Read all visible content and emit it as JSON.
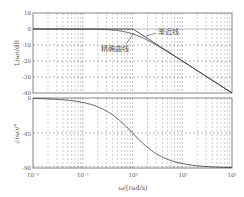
{
  "figure": {
    "xlabel": "ω/(rad/s)",
    "x_tick_labels": [
      "10⁻²",
      "10⁻¹",
      "10⁰",
      "10¹",
      "10²"
    ]
  },
  "magnitude_plot": {
    "ylabel": "L(ω)/dB",
    "y_tick_labels": [
      "10",
      "0",
      "-10",
      "-20",
      "-30",
      "-40"
    ],
    "annotations": {
      "asymptote": "渐近线",
      "exact_curve": "精确曲线"
    }
  },
  "phase_plot": {
    "ylabel": "∠(ω)/°",
    "y_tick_labels": [
      "0",
      "-45",
      "-90"
    ]
  },
  "chart_data": [
    {
      "type": "line",
      "title": "",
      "xlabel": "ω/(rad/s)",
      "ylabel": "L(ω)/dB",
      "xscale": "log",
      "xlim": [
        0.01,
        100
      ],
      "ylim": [
        -40,
        10
      ],
      "yticks": [
        10,
        0,
        -10,
        -20,
        -30,
        -40
      ],
      "grid": true,
      "series": [
        {
          "name": "渐近线",
          "x": [
            0.01,
            1,
            100
          ],
          "y": [
            0,
            0,
            -40
          ]
        },
        {
          "name": "精确曲线",
          "x": [
            0.01,
            0.1,
            0.3,
            0.5,
            1,
            2,
            3,
            10,
            100
          ],
          "y": [
            0,
            -0.04,
            -0.4,
            -1,
            -3,
            -7,
            -10,
            -20,
            -40
          ]
        }
      ],
      "annotations": [
        "渐近线",
        "精确曲线"
      ]
    },
    {
      "type": "line",
      "title": "",
      "xlabel": "ω/(rad/s)",
      "ylabel": "∠(ω)/°",
      "xscale": "log",
      "xlim": [
        0.01,
        100
      ],
      "ylim": [
        -90,
        0
      ],
      "yticks": [
        0,
        -45,
        -90
      ],
      "grid": true,
      "series": [
        {
          "name": "phase",
          "x": [
            0.01,
            0.1,
            0.2,
            0.5,
            1,
            2,
            5,
            10,
            100
          ],
          "y": [
            -0.6,
            -5.7,
            -11.3,
            -26.6,
            -45,
            -63.4,
            -78.7,
            -84.3,
            -89.4
          ]
        }
      ]
    }
  ]
}
